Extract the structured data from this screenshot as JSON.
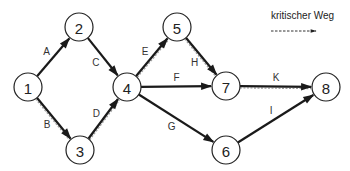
{
  "legend": {
    "label": "kritischer Weg",
    "style": "dashed"
  },
  "colors": {
    "edge": "#1a1a1a",
    "critical_dash": "#9a9a9a",
    "node_stroke": "#222222",
    "background": "#ffffff"
  },
  "nodes": [
    {
      "id": "1",
      "label": "1",
      "x": 28,
      "y": 87
    },
    {
      "id": "2",
      "label": "2",
      "x": 79,
      "y": 27
    },
    {
      "id": "3",
      "label": "3",
      "x": 80,
      "y": 150
    },
    {
      "id": "4",
      "label": "4",
      "x": 127,
      "y": 87
    },
    {
      "id": "5",
      "label": "5",
      "x": 177,
      "y": 27
    },
    {
      "id": "6",
      "label": "6",
      "x": 226,
      "y": 150
    },
    {
      "id": "7",
      "label": "7",
      "x": 226,
      "y": 86
    },
    {
      "id": "8",
      "label": "8",
      "x": 326,
      "y": 87
    }
  ],
  "edges": [
    {
      "label": "A",
      "from": "1",
      "to": "2",
      "critical": false
    },
    {
      "label": "B",
      "from": "1",
      "to": "3",
      "critical": true
    },
    {
      "label": "C",
      "from": "2",
      "to": "4",
      "critical": false
    },
    {
      "label": "D",
      "from": "3",
      "to": "4",
      "critical": true
    },
    {
      "label": "E",
      "from": "4",
      "to": "5",
      "critical": true
    },
    {
      "label": "F",
      "from": "4",
      "to": "7",
      "critical": false
    },
    {
      "label": "G",
      "from": "4",
      "to": "6",
      "critical": false
    },
    {
      "label": "H",
      "from": "5",
      "to": "7",
      "critical": true
    },
    {
      "label": "I",
      "from": "6",
      "to": "8",
      "critical": false
    },
    {
      "label": "K",
      "from": "7",
      "to": "8",
      "critical": true
    }
  ]
}
